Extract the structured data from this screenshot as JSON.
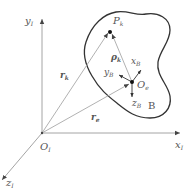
{
  "diagram": {
    "type": "coordinate-frame-diagram",
    "colors": {
      "axis": "#9a9a9a",
      "vector": "#a8a8a8",
      "outline": "#333333",
      "label": "#555555",
      "point": "#111111"
    },
    "inertial_frame": {
      "origin": {
        "label": "O",
        "subscript": "I"
      },
      "x_axis": {
        "label": "x",
        "subscript": "I"
      },
      "y_axis": {
        "label": "y",
        "subscript": "I"
      },
      "z_axis": {
        "label": "z",
        "subscript": "I"
      }
    },
    "body": {
      "name": "B",
      "origin": {
        "label": "O",
        "subscript": "e"
      },
      "x_axis": {
        "label": "x",
        "subscript": "B"
      },
      "y_axis": {
        "label": "y",
        "subscript": "B"
      },
      "z_axis": {
        "label": "z",
        "subscript": "B"
      }
    },
    "point": {
      "label": "P",
      "subscript": "k"
    },
    "vectors": [
      {
        "label": "r",
        "subscript": "k",
        "from": "O_I",
        "to": "P_k"
      },
      {
        "label": "r",
        "subscript": "e",
        "from": "O_I",
        "to": "O_e"
      },
      {
        "label": "ρ",
        "subscript": "k",
        "from": "O_e",
        "to": "P_k"
      }
    ]
  }
}
